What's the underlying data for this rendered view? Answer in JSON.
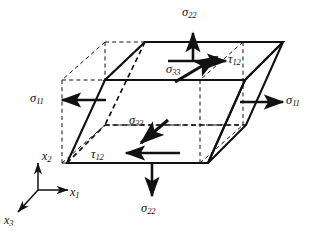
{
  "figure": {
    "type": "stress-element-diagram",
    "caption": "",
    "colors": {
      "line": "#111111",
      "dashed": "#111111",
      "background": "#ffffff",
      "caption": "#9b9b9b"
    },
    "labels": {
      "sigma22_top": {
        "sym": "σ",
        "sub": "22"
      },
      "sigma22_bottom": {
        "sym": "σ",
        "sub": "22"
      },
      "sigma11_left": {
        "sym": "σ",
        "sub": "11"
      },
      "sigma11_right": {
        "sym": "σ",
        "sub": "11"
      },
      "sigma33_top": {
        "sym": "σ",
        "sub": "33"
      },
      "sigma33_inner": {
        "sym": "σ",
        "sub": "33"
      },
      "tau12_top": {
        "sym": "τ",
        "sub": "12"
      },
      "tau12_bottom": {
        "sym": "τ",
        "sub": "12"
      }
    },
    "axes": {
      "x1": {
        "sym": "x",
        "sub": "1"
      },
      "x2": {
        "sym": "x",
        "sub": "2"
      },
      "x3": {
        "sym": "x",
        "sub": "3"
      }
    }
  }
}
